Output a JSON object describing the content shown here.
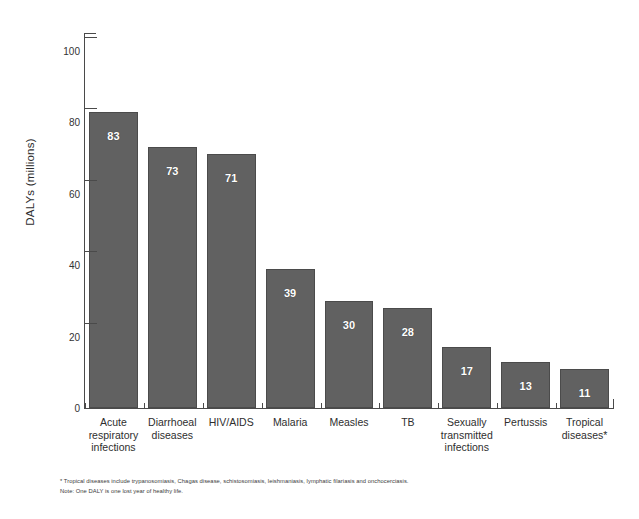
{
  "chart_data": {
    "type": "bar",
    "title": "",
    "xlabel": "",
    "ylabel": "DALYs (millions)",
    "ylim": [
      0,
      105
    ],
    "ytick_labels": [
      "100",
      "80",
      "60",
      "40",
      "20",
      "0"
    ],
    "ytick_values": [
      100,
      80,
      60,
      40,
      20,
      0
    ],
    "grid": false,
    "legend": "none",
    "categories": [
      "Acute respiratory infections",
      "Diarrhoeal diseases",
      "HIV/AIDS",
      "Malaria",
      "Measles",
      "TB",
      "Sexually transmitted infections",
      "Pertussis",
      "Tropical diseases*"
    ],
    "category_lines": [
      [
        "Acute",
        "respiratory",
        "infections"
      ],
      [
        "Diarrhoeal",
        "diseases"
      ],
      [
        "HIV/AIDS"
      ],
      [
        "Malaria"
      ],
      [
        "Measles"
      ],
      [
        "TB"
      ],
      [
        "Sexually",
        "transmitted",
        "infections"
      ],
      [
        "Pertussis"
      ],
      [
        "Tropical",
        "diseases*"
      ]
    ],
    "values": [
      83,
      73,
      71,
      39,
      30,
      28,
      17,
      13,
      11
    ],
    "value_labels": [
      "83",
      "73",
      "71",
      "39",
      "30",
      "28",
      "17",
      "13",
      "11"
    ],
    "bar_color": "#616161",
    "value_label_color": "#ffffff",
    "axis_color": "#4a4a4a"
  },
  "footnotes": {
    "line1": "* Tropical diseases include trypanosomiasis, Chagas disease, schistosomiasis, leishmaniasis, lymphatic filariasis and onchocerciasis.",
    "line2": "Note: One DALY is one lost year of healthy life."
  }
}
